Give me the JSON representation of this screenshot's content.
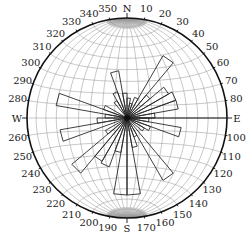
{
  "diagram": {
    "type": "rose-diagram-on-stereonet",
    "center": [
      127,
      118
    ],
    "radius": 100,
    "colors": {
      "outline": "#111111",
      "grid": "#9a9a9a",
      "petal": "#2a2a2a",
      "background": "#ffffff"
    },
    "cardinals": [
      {
        "label": "N",
        "angle": 0
      },
      {
        "label": "E",
        "angle": 90
      },
      {
        "label": "S",
        "angle": 180
      },
      {
        "label": "W",
        "angle": 270
      }
    ],
    "degree_labels": [
      "10",
      "20",
      "30",
      "40",
      "50",
      "60",
      "70",
      "80",
      "100",
      "110",
      "120",
      "130",
      "140",
      "150",
      "160",
      "170",
      "190",
      "200",
      "210",
      "220",
      "230",
      "240",
      "250",
      "260",
      "280",
      "290",
      "300",
      "310",
      "320",
      "330",
      "340",
      "350"
    ],
    "degree_values": [
      10,
      20,
      30,
      40,
      50,
      60,
      70,
      80,
      100,
      110,
      120,
      130,
      140,
      150,
      160,
      170,
      190,
      200,
      210,
      220,
      230,
      240,
      250,
      260,
      280,
      290,
      300,
      310,
      320,
      330,
      340,
      350
    ]
  },
  "chart_data": {
    "type": "rose",
    "title": "",
    "bin_width_deg": 10,
    "length_units": "relative (fraction of net radius)",
    "petals": [
      {
        "from": 0,
        "to": 10,
        "length": 0.2
      },
      {
        "from": 10,
        "to": 20,
        "length": 0.15
      },
      {
        "from": 20,
        "to": 30,
        "length": 0.22
      },
      {
        "from": 30,
        "to": 40,
        "length": 0.72
      },
      {
        "from": 40,
        "to": 50,
        "length": 0.3
      },
      {
        "from": 50,
        "to": 60,
        "length": 0.48
      },
      {
        "from": 60,
        "to": 70,
        "length": 0.52
      },
      {
        "from": 70,
        "to": 80,
        "length": 0.52
      },
      {
        "from": 80,
        "to": 90,
        "length": 0.28
      },
      {
        "from": 90,
        "to": 100,
        "length": 0.22
      },
      {
        "from": 100,
        "to": 110,
        "length": 0.55
      },
      {
        "from": 110,
        "to": 120,
        "length": 0.25
      },
      {
        "from": 120,
        "to": 130,
        "length": 0.2
      },
      {
        "from": 140,
        "to": 150,
        "length": 0.72
      },
      {
        "from": 150,
        "to": 160,
        "length": 0.2
      },
      {
        "from": 160,
        "to": 170,
        "length": 0.3
      },
      {
        "from": 170,
        "to": 180,
        "length": 0.77
      },
      {
        "from": 180,
        "to": 190,
        "length": 0.77
      },
      {
        "from": 190,
        "to": 200,
        "length": 0.35
      },
      {
        "from": 200,
        "to": 210,
        "length": 0.52
      },
      {
        "from": 210,
        "to": 220,
        "length": 0.5
      },
      {
        "from": 220,
        "to": 230,
        "length": 0.72
      },
      {
        "from": 230,
        "to": 240,
        "length": 0.25
      },
      {
        "from": 250,
        "to": 260,
        "length": 0.68
      },
      {
        "from": 260,
        "to": 270,
        "length": 0.3
      },
      {
        "from": 270,
        "to": 280,
        "length": 0.22
      },
      {
        "from": 280,
        "to": 290,
        "length": 0.72
      },
      {
        "from": 290,
        "to": 300,
        "length": 0.25
      },
      {
        "from": 320,
        "to": 330,
        "length": 0.2
      },
      {
        "from": 330,
        "to": 340,
        "length": 0.28
      },
      {
        "from": 340,
        "to": 350,
        "length": 0.48
      },
      {
        "from": 350,
        "to": 360,
        "length": 0.25
      }
    ],
    "axis_lines": [
      {
        "from": 90,
        "to": 270,
        "label": "E-W line"
      }
    ],
    "grid": "equal-area stereonet (10° great & small circles)"
  }
}
